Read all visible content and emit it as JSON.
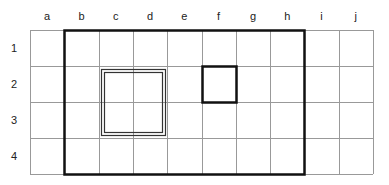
{
  "diagram": {
    "title": "",
    "columns": [
      "a",
      "b",
      "c",
      "d",
      "e",
      "f",
      "g",
      "h",
      "i",
      "j"
    ],
    "rows": [
      "1",
      "2",
      "3",
      "4"
    ],
    "grid": {
      "left": 30,
      "top": 30,
      "col_width": 34.3,
      "row_height": 36,
      "line_color": "#999999",
      "line_width": 1
    },
    "shapes": [
      {
        "name": "thick-outer-region",
        "style": "thick-solid",
        "from_col": "b",
        "to_col": "h",
        "from_row": "1",
        "to_row": "4",
        "color": "#111111",
        "stroke_width": 2.5
      },
      {
        "name": "double-line-region",
        "style": "double",
        "from_col": "c",
        "to_col": "d",
        "from_row": "2",
        "to_row": "3",
        "color": "#333333"
      },
      {
        "name": "thick-cell-f2",
        "style": "thick-solid",
        "from_col": "f",
        "to_col": "f",
        "from_row": "2",
        "to_row": "2",
        "color": "#111111",
        "stroke_width": 2.5
      }
    ]
  }
}
